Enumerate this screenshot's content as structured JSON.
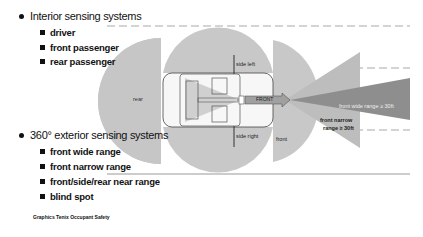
{
  "slide": {
    "sections": [
      {
        "heading": "Interior sensing systems",
        "items": [
          "driver",
          "front passenger",
          "rear passenger"
        ]
      },
      {
        "heading": "360° exterior sensing systems",
        "items": [
          "front wide range",
          "front narrow range",
          "front/side/rear near range",
          "blind spot"
        ]
      }
    ],
    "footer": "Graphics Tenix Occupant Safety"
  },
  "diagram": {
    "labels": {
      "rear": "rear",
      "side_left": "side left",
      "side_right": "side right",
      "front": "front",
      "front_arrow": "FRONT",
      "front_wide": "front wide range ≥ 30ft",
      "front_narrow_line1": "front narrow",
      "front_narrow_line2": "range ≥ 30ft"
    },
    "colors": {
      "near_zone": "#c8c8c8",
      "zone_dark": "#b4b4b4",
      "wide_range": "#9a9a9a",
      "narrow_range": "#c0c0c0",
      "car_outline": "#444444",
      "dash": "#aaaaaa"
    }
  }
}
